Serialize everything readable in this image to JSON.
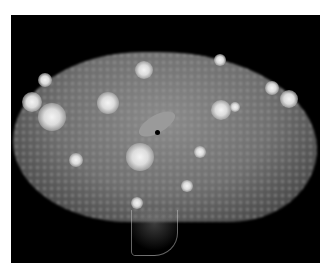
{
  "image": {
    "description": "Grayscale fluorescence micrograph of a tissue section (liver-like lobe) on black background with multiple bright nodules and a central vessel",
    "colors": {
      "background": "#000000",
      "border": "#ffffff",
      "tissue": "#7a7a7a",
      "nodule": "#eeeeee"
    },
    "nodules": [
      {
        "x": 32,
        "y": 102,
        "r": 10
      },
      {
        "x": 52,
        "y": 117,
        "r": 14
      },
      {
        "x": 45,
        "y": 80,
        "r": 7
      },
      {
        "x": 108,
        "y": 103,
        "r": 11
      },
      {
        "x": 144,
        "y": 70,
        "r": 9
      },
      {
        "x": 221,
        "y": 110,
        "r": 10
      },
      {
        "x": 289,
        "y": 99,
        "r": 9
      },
      {
        "x": 272,
        "y": 88,
        "r": 7
      },
      {
        "x": 140,
        "y": 157,
        "r": 14
      },
      {
        "x": 76,
        "y": 160,
        "r": 7
      },
      {
        "x": 200,
        "y": 152,
        "r": 6
      },
      {
        "x": 137,
        "y": 203,
        "r": 6
      },
      {
        "x": 187,
        "y": 186,
        "r": 6
      },
      {
        "x": 220,
        "y": 60,
        "r": 6
      },
      {
        "x": 235,
        "y": 107,
        "r": 5
      }
    ]
  }
}
